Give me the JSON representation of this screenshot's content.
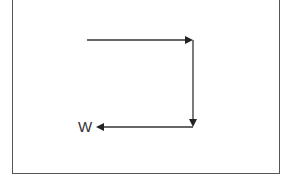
{
  "diagram": {
    "label": "W",
    "colors": {
      "line": "#333333",
      "frame": "#555555",
      "background": "#ffffff"
    },
    "segments": [
      {
        "from": [
          87,
          40
        ],
        "to": [
          193,
          40
        ],
        "direction": "right"
      },
      {
        "from": [
          193,
          40
        ],
        "to": [
          193,
          126
        ],
        "direction": "down"
      },
      {
        "from": [
          193,
          127
        ],
        "to": [
          97,
          127
        ],
        "direction": "left"
      }
    ]
  }
}
